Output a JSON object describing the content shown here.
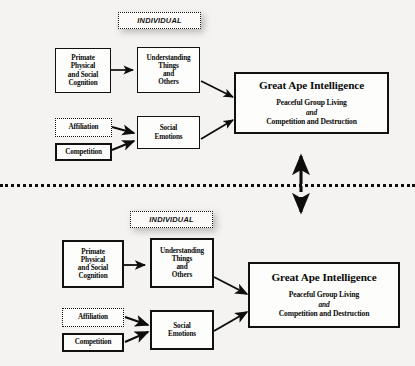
{
  "figure": {
    "background_color": "#f4f3f1",
    "line_color": "#111111",
    "divider_label": "dotted-separator"
  },
  "panels": [
    {
      "id": "top-panel",
      "individual_tag": "INDIVIDUAL",
      "nodes": {
        "primate_cognition": "Primate\nPhysical\nand Social\nCognition",
        "primate_cognition_lines": [
          "Primate",
          "Physical",
          "and Social",
          "Cognition"
        ],
        "understanding": "Understanding\nThings\nand\nOthers",
        "understanding_lines": [
          "Understanding",
          "Things",
          "and",
          "Others"
        ],
        "affiliation": "Affiliation",
        "competition": "Competition",
        "social_emotions_lines": [
          "Social",
          "Emotions"
        ],
        "outcome_title": "Great Ape Intelligence",
        "outcome_line1": "Peaceful Group Living",
        "outcome_conjunction": "and",
        "outcome_line2": "Competition and Destruction"
      }
    },
    {
      "id": "bottom-panel",
      "individual_tag": "INDIVIDUAL",
      "nodes": {
        "primate_cognition_lines": [
          "Primate",
          "Physical",
          "and Social",
          "Cognition"
        ],
        "understanding_lines": [
          "Understanding",
          "Things",
          "and",
          "Others"
        ],
        "affiliation": "Affiliation",
        "competition": "Competition",
        "social_emotions_lines": [
          "Social",
          "Emotions"
        ],
        "outcome_title": "Great Ape Intelligence",
        "outcome_line1": "Peaceful Group Living",
        "outcome_conjunction": "and",
        "outcome_line2": "Competition and Destruction"
      }
    }
  ],
  "connectors": {
    "up_arrow": "solid-up-arrow",
    "down_arrow": "dashed-down-arrow"
  }
}
